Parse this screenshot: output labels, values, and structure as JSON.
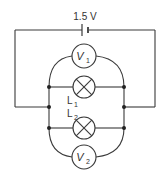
{
  "diagram": {
    "type": "circuit",
    "battery": {
      "label": "1.5 V"
    },
    "voltmeters": [
      {
        "id": "V1",
        "label": "V",
        "subscript": "1",
        "position": "top, across L1"
      },
      {
        "id": "V2",
        "label": "V",
        "subscript": "2",
        "position": "bottom, across L2"
      }
    ],
    "lamps": [
      {
        "id": "L1",
        "label": "L",
        "subscript": "1"
      },
      {
        "id": "L2",
        "label": "L",
        "subscript": "2"
      }
    ],
    "colors": {
      "line": "#3a3a3a",
      "background": "#ffffff"
    }
  }
}
